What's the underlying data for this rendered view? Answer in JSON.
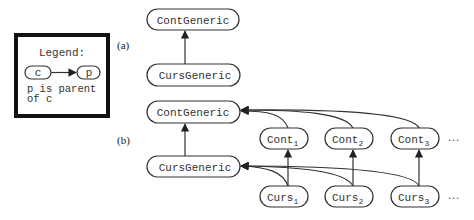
{
  "legend": {
    "title": "Legend:",
    "child_node": "c",
    "parent_node": "p",
    "description_line1": "p is parent",
    "description_line2": "of c"
  },
  "part_a": {
    "label": "(a)",
    "top_node": "ContGeneric",
    "bottom_node": "CursGeneric"
  },
  "part_b": {
    "label": "(b)",
    "cont_generic": "ContGeneric",
    "curs_generic": "CursGeneric",
    "cont_nodes": [
      {
        "base": "Cont",
        "sub": "1"
      },
      {
        "base": "Cont",
        "sub": "2"
      },
      {
        "base": "Cont",
        "sub": "3"
      }
    ],
    "curs_nodes": [
      {
        "base": "Curs",
        "sub": "1"
      },
      {
        "base": "Curs",
        "sub": "2"
      },
      {
        "base": "Curs",
        "sub": "3"
      }
    ],
    "ellipsis": "..."
  },
  "colors": {
    "stroke": "#333333",
    "legend_border": "#111111",
    "background": "#ffffff"
  }
}
